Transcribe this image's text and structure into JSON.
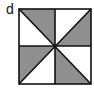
{
  "label": "d",
  "colors": {
    "shade": "#8f8f8f",
    "line": "#111111",
    "background": "#ffffff"
  },
  "square": {
    "x": 19,
    "y": 9,
    "size": 72
  },
  "shaded_triangles": [
    "top-left-upper",
    "top-right-lower",
    "bottom-left-upper",
    "bottom-right-lower"
  ]
}
